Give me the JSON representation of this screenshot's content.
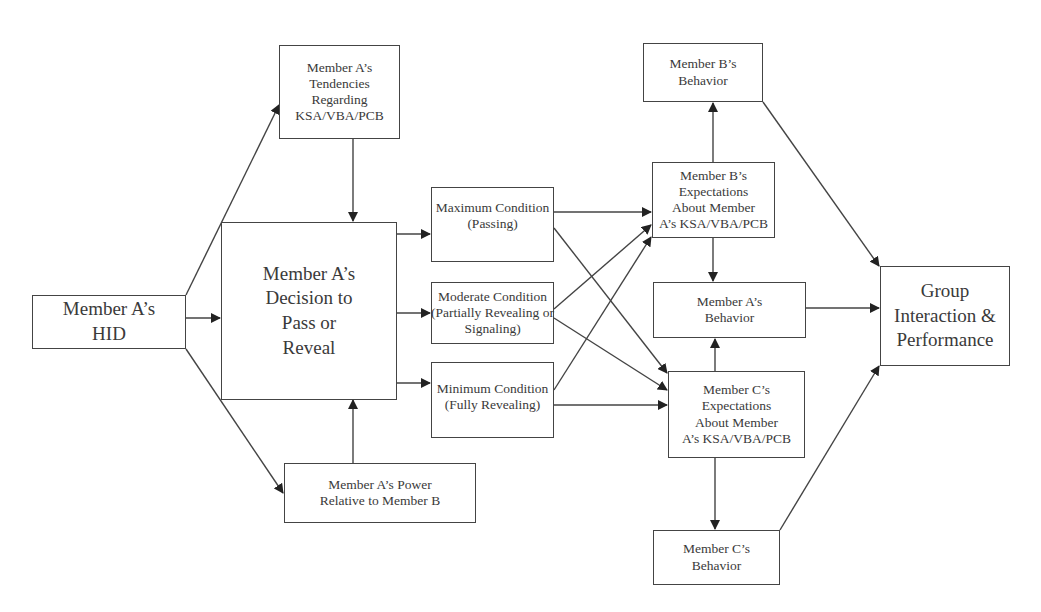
{
  "diagram": {
    "nodes": {
      "hid": {
        "lines": [
          "Member A’s",
          "HID"
        ]
      },
      "tendencies": {
        "lines": [
          "Member A’s",
          "Tendencies",
          "Regarding",
          "KSA/VBA/PCB"
        ]
      },
      "decision": {
        "lines": [
          "Member A’s",
          "Decision to",
          "Pass or",
          "Reveal"
        ]
      },
      "power": {
        "lines": [
          "Member A’s Power",
          "Relative to Member B"
        ]
      },
      "max_condition": {
        "lines": [
          "Maximum Condition",
          "(Passing)"
        ]
      },
      "moderate_condition": {
        "lines": [
          "Moderate Condition",
          "(Partially Revealing or",
          "Signaling)"
        ]
      },
      "min_condition": {
        "lines": [
          "Minimum Condition",
          "(Fully Revealing)"
        ]
      },
      "b_behavior": {
        "lines": [
          "Member B’s",
          "Behavior"
        ]
      },
      "b_expectations": {
        "lines": [
          "Member B’s",
          "Expectations",
          "About  Member",
          "A’s KSA/VBA/PCB"
        ]
      },
      "a_behavior": {
        "lines": [
          "Member A’s",
          "Behavior"
        ]
      },
      "c_expectations": {
        "lines": [
          "Member C’s",
          "Expectations",
          "About  Member",
          "A’s KSA/VBA/PCB"
        ]
      },
      "c_behavior": {
        "lines": [
          "Member C’s",
          "Behavior"
        ]
      },
      "group": {
        "lines": [
          "Group",
          "Interaction &",
          "Performance"
        ]
      }
    },
    "edges": [
      [
        "hid",
        "tendencies"
      ],
      [
        "hid",
        "decision"
      ],
      [
        "hid",
        "power"
      ],
      [
        "tendencies",
        "decision"
      ],
      [
        "power",
        "decision"
      ],
      [
        "decision",
        "max_condition"
      ],
      [
        "decision",
        "moderate_condition"
      ],
      [
        "decision",
        "min_condition"
      ],
      [
        "max_condition",
        "b_expectations"
      ],
      [
        "max_condition",
        "c_expectations"
      ],
      [
        "moderate_condition",
        "b_expectations"
      ],
      [
        "moderate_condition",
        "c_expectations"
      ],
      [
        "min_condition",
        "b_expectations"
      ],
      [
        "min_condition",
        "c_expectations"
      ],
      [
        "b_expectations",
        "b_behavior"
      ],
      [
        "b_expectations",
        "a_behavior"
      ],
      [
        "c_expectations",
        "a_behavior"
      ],
      [
        "c_expectations",
        "c_behavior"
      ],
      [
        "b_behavior",
        "group"
      ],
      [
        "a_behavior",
        "group"
      ],
      [
        "c_behavior",
        "group"
      ]
    ]
  }
}
